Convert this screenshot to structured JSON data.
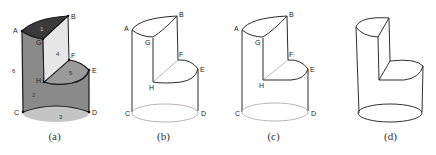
{
  "figure": {
    "panels": [
      {
        "id": "a",
        "caption": "(a)",
        "style": "shaded",
        "vertices": {
          "A": "A",
          "B": "B",
          "C": "C",
          "D": "D",
          "E": "E",
          "F": "F",
          "G": "G",
          "H": "H"
        },
        "faces": {
          "f1": "1",
          "f2": "2",
          "f3": "3",
          "f4": "4",
          "f5": "5",
          "f6": "6"
        }
      },
      {
        "id": "b",
        "caption": "(b)",
        "style": "outline-labeled",
        "vertices": {
          "A": "A",
          "B": "B",
          "C": "C",
          "D": "D",
          "E": "E",
          "F": "F",
          "G": "G",
          "H": "H"
        }
      },
      {
        "id": "c",
        "caption": "(c)",
        "style": "outline-labeled",
        "vertices": {
          "A": "A",
          "B": "B",
          "C": "C",
          "D": "D",
          "E": "E",
          "F": "F",
          "G": "G",
          "H": "H"
        }
      },
      {
        "id": "d",
        "caption": "(d)",
        "style": "outline-unlabeled"
      }
    ],
    "colors": {
      "top_face": "#3a3a3a",
      "side_face": "#8a8a8a",
      "inner_face": "#e6e6e6",
      "step_face": "#9a9a9a",
      "bottom_face": "#c4c4c4",
      "stroke": "#1a1a1a",
      "thin_stroke": "#444444"
    }
  }
}
